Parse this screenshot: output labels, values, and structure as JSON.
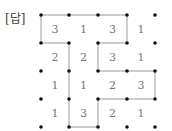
{
  "label": "[답]",
  "grid": {
    "dots_x": [
      41,
      69,
      98,
      127,
      155
    ],
    "dots_y": [
      15,
      43,
      71,
      99,
      127
    ],
    "cells": [
      [
        3,
        1,
        3,
        1
      ],
      [
        2,
        2,
        3,
        1
      ],
      [
        1,
        1,
        2,
        3
      ],
      [
        1,
        3,
        2,
        1
      ]
    ],
    "edges": [
      [
        [
          0,
          0
        ],
        [
          1,
          0
        ]
      ],
      [
        [
          1,
          0
        ],
        [
          2,
          0
        ]
      ],
      [
        [
          2,
          0
        ],
        [
          3,
          0
        ]
      ],
      [
        [
          0,
          0
        ],
        [
          0,
          1
        ]
      ],
      [
        [
          3,
          0
        ],
        [
          3,
          1
        ]
      ],
      [
        [
          0,
          1
        ],
        [
          1,
          1
        ]
      ],
      [
        [
          2,
          1
        ],
        [
          3,
          1
        ]
      ],
      [
        [
          1,
          1
        ],
        [
          1,
          2
        ]
      ],
      [
        [
          1,
          2
        ],
        [
          1,
          3
        ]
      ],
      [
        [
          1,
          3
        ],
        [
          1,
          4
        ]
      ],
      [
        [
          2,
          1
        ],
        [
          2,
          2
        ]
      ],
      [
        [
          2,
          2
        ],
        [
          3,
          2
        ]
      ],
      [
        [
          3,
          2
        ],
        [
          4,
          2
        ]
      ],
      [
        [
          4,
          2
        ],
        [
          4,
          3
        ]
      ],
      [
        [
          2,
          3
        ],
        [
          3,
          3
        ]
      ],
      [
        [
          3,
          3
        ],
        [
          4,
          3
        ]
      ],
      [
        [
          2,
          3
        ],
        [
          2,
          4
        ]
      ],
      [
        [
          1,
          4
        ],
        [
          2,
          4
        ]
      ]
    ],
    "line_color": "#999999",
    "dot_color": "#111111",
    "number_color": "#777777"
  }
}
